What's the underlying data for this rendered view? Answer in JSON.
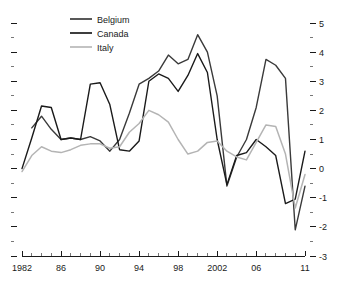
{
  "chart_data": {
    "type": "line",
    "title": "",
    "xlabel": "",
    "ylabel": "",
    "xlim": [
      1982,
      2011
    ],
    "ylim": [
      -3,
      5
    ],
    "grid": false,
    "legend_position": "top-left",
    "y_axis_side": "right",
    "x_tick_labels": [
      "1982",
      "86",
      "90",
      "94",
      "98",
      "2002",
      "06",
      "11"
    ],
    "x_tick_values": [
      1982,
      1986,
      1990,
      1994,
      1998,
      2002,
      2006,
      2011
    ],
    "x_minor_tick_step": 1,
    "y_tick_labels": [
      "5",
      "4",
      "3",
      "2",
      "1",
      "0",
      "-1",
      "-2",
      "-3"
    ],
    "y_tick_values": [
      5,
      4,
      3,
      2,
      1,
      0,
      -1,
      -2,
      -3
    ],
    "y_minor_tick_step": 0.5,
    "x": [
      1982,
      1983,
      1984,
      1985,
      1986,
      1987,
      1988,
      1989,
      1990,
      1991,
      1992,
      1993,
      1994,
      1995,
      1996,
      1997,
      1998,
      1999,
      2000,
      2001,
      2002,
      2003,
      2004,
      2005,
      2006,
      2007,
      2008,
      2009,
      2010,
      2011
    ],
    "series": [
      {
        "name": "Belgium",
        "color": "#3a3a3a",
        "values": [
          null,
          1.4,
          1.8,
          1.35,
          1.0,
          1.05,
          1.0,
          1.1,
          0.95,
          0.6,
          1.0,
          1.9,
          2.9,
          3.1,
          3.35,
          3.9,
          3.6,
          3.75,
          4.6,
          4.0,
          2.5,
          -0.6,
          0.4,
          1.0,
          2.1,
          3.75,
          3.55,
          3.1,
          -2.1,
          -0.6
        ]
      },
      {
        "name": "Canada",
        "color": "#1a1a1a",
        "values": [
          0.0,
          1.05,
          2.15,
          2.1,
          1.0,
          1.05,
          1.0,
          2.9,
          2.95,
          2.2,
          0.65,
          0.6,
          0.95,
          3.0,
          3.25,
          3.1,
          2.65,
          3.2,
          3.95,
          3.3,
          1.0,
          -0.55,
          0.45,
          0.55,
          1.0,
          0.75,
          0.45,
          -1.2,
          -1.05,
          0.6
        ]
      },
      {
        "name": "Italy",
        "color": "#b4b4b4",
        "values": [
          -0.1,
          0.45,
          0.75,
          0.6,
          0.55,
          0.65,
          0.8,
          0.85,
          0.85,
          0.7,
          0.75,
          1.25,
          1.55,
          2.0,
          1.85,
          1.6,
          1.0,
          0.5,
          0.6,
          0.9,
          0.95,
          0.6,
          0.4,
          0.3,
          0.9,
          1.5,
          1.45,
          0.5,
          -1.35,
          -0.2
        ]
      }
    ]
  },
  "legend": {
    "entries": [
      {
        "label": "Belgium"
      },
      {
        "label": "Canada"
      },
      {
        "label": "Italy"
      }
    ]
  }
}
